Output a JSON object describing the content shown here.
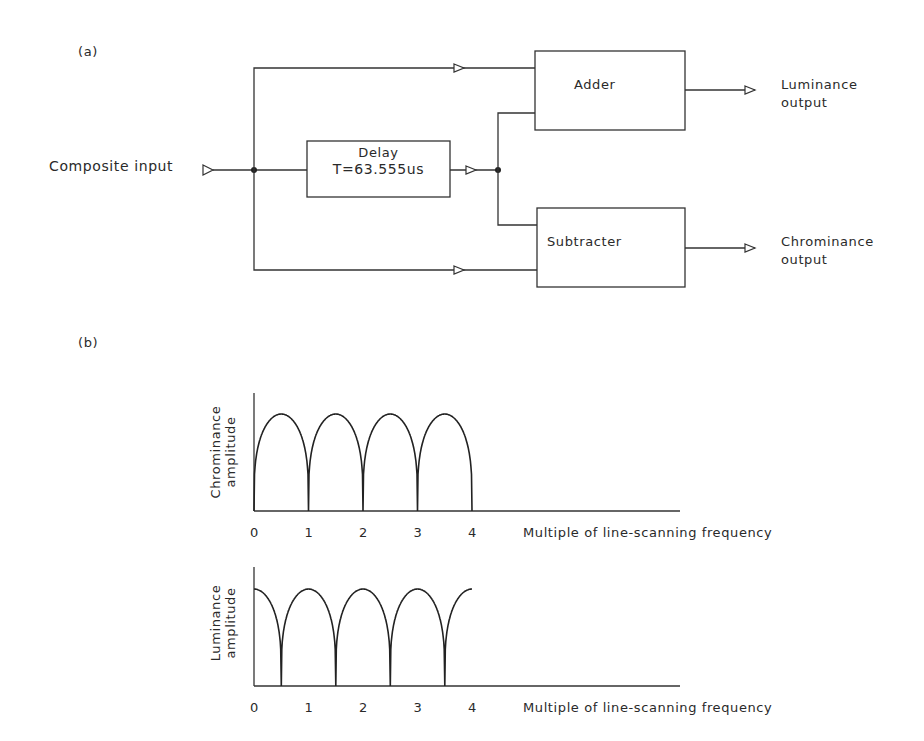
{
  "figure": {
    "part_a": {
      "label": "(a)",
      "input_label": "Composite input",
      "delay_box": {
        "line1": "Delay",
        "line2": "T=63.555us"
      },
      "adder_box": {
        "label": "Adder"
      },
      "subtracter_box": {
        "label": "Subtracter"
      },
      "outputs": {
        "luminance": {
          "line1": "Luminance",
          "line2": "output"
        },
        "chrominance": {
          "line1": "Chrominance",
          "line2": "output"
        }
      }
    },
    "part_b": {
      "label": "(b)"
    }
  },
  "chart_data": [
    {
      "type": "line",
      "title": "",
      "ylabel": "Chrominance amplitude",
      "ylabel_lines": [
        "Chrominance",
        "amplitude"
      ],
      "xlabel": "Multiple of line-scanning frequency",
      "x_ticks": [
        "0",
        "1",
        "2",
        "3",
        "4"
      ],
      "xlim": [
        0,
        8
      ],
      "grid": false,
      "description": "Comb response with nulls at integer multiples (0,1,2,3,4) and peaks at half-integers (0.5,1.5,2.5,3.5); response ends at 4",
      "series": [
        {
          "name": "Chrominance",
          "x": [
            0,
            0.5,
            1,
            1.5,
            2,
            2.5,
            3,
            3.5,
            4
          ],
          "values": [
            0,
            1,
            0,
            1,
            0,
            1,
            0,
            1,
            0
          ]
        }
      ]
    },
    {
      "type": "line",
      "title": "",
      "ylabel": "Luminance amplitude",
      "ylabel_lines": [
        "Luminance",
        "amplitude"
      ],
      "xlabel": "Multiple of line-scanning frequency",
      "x_ticks": [
        "0",
        "1",
        "2",
        "3",
        "4"
      ],
      "xlim": [
        0,
        8
      ],
      "grid": false,
      "description": "Comb response with peaks at integer multiples (0,1,2,3,4) and nulls at half-integers (0.5,1.5,2.5,3.5)",
      "series": [
        {
          "name": "Luminance",
          "x": [
            0,
            0.5,
            1,
            1.5,
            2,
            2.5,
            3,
            3.5,
            4
          ],
          "values": [
            1,
            0,
            1,
            0,
            1,
            0,
            1,
            0,
            1
          ]
        }
      ]
    }
  ]
}
